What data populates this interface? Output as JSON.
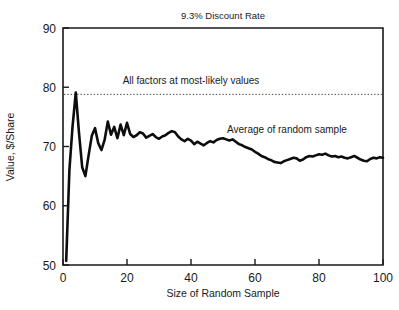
{
  "chart_data": {
    "type": "line",
    "title": "9.3% Discount Rate",
    "xlabel": "Size of Random Sample",
    "ylabel": "Value, $/Share",
    "xlim": [
      0,
      100
    ],
    "ylim": [
      50,
      90
    ],
    "xticks": [
      "0",
      "20",
      "40",
      "60",
      "80",
      "100"
    ],
    "xtick_values": [
      0,
      20,
      40,
      60,
      80,
      100
    ],
    "yticks": [
      "50",
      "60",
      "70",
      "80",
      "90"
    ],
    "ytick_values": [
      50,
      60,
      70,
      80,
      90
    ],
    "grid": false,
    "legend": "none",
    "annotations": [
      {
        "name": "most-likely-line-label",
        "text": "All factors at most-likely values",
        "x": 40,
        "y": 80.6
      },
      {
        "name": "average-curve-label",
        "text": "Average of random sample",
        "x": 70,
        "y": 72.2
      }
    ],
    "reference_lines": [
      {
        "name": "all-factors-most-likely",
        "orientation": "horizontal",
        "value": 78.8,
        "style": "dotted"
      }
    ],
    "series": [
      {
        "name": "Average of random sample",
        "style": "solid",
        "color": "#0d0d0d",
        "x": [
          1,
          2,
          3,
          4,
          5,
          6,
          7,
          8,
          9,
          10,
          11,
          12,
          13,
          14,
          15,
          16,
          17,
          18,
          19,
          20,
          21,
          22,
          23,
          24,
          25,
          26,
          27,
          28,
          29,
          30,
          31,
          32,
          33,
          34,
          35,
          36,
          37,
          38,
          39,
          40,
          41,
          42,
          43,
          44,
          45,
          46,
          47,
          48,
          49,
          50,
          51,
          52,
          53,
          54,
          55,
          56,
          57,
          58,
          59,
          60,
          61,
          62,
          63,
          64,
          65,
          66,
          67,
          68,
          69,
          70,
          71,
          72,
          73,
          74,
          75,
          76,
          77,
          78,
          79,
          80,
          81,
          82,
          83,
          84,
          85,
          86,
          87,
          88,
          89,
          90,
          91,
          92,
          93,
          94,
          95,
          96,
          97,
          98,
          99,
          100
        ],
        "values": [
          50.7,
          66.0,
          73.5,
          79.1,
          72.3,
          66.5,
          65.0,
          68.5,
          71.8,
          73.1,
          70.6,
          69.4,
          71.1,
          74.2,
          72.0,
          73.3,
          71.4,
          73.7,
          71.9,
          74.0,
          72.1,
          71.6,
          71.9,
          72.4,
          72.2,
          71.5,
          71.8,
          72.1,
          71.6,
          71.3,
          71.7,
          71.9,
          72.3,
          72.6,
          72.4,
          71.7,
          71.2,
          70.9,
          71.3,
          71.0,
          70.4,
          70.8,
          70.5,
          70.2,
          70.6,
          70.9,
          70.7,
          71.1,
          71.3,
          71.4,
          71.2,
          71.0,
          71.2,
          70.8,
          70.4,
          70.2,
          69.9,
          69.7,
          69.5,
          69.1,
          68.8,
          68.4,
          68.2,
          67.9,
          67.7,
          67.4,
          67.3,
          67.2,
          67.5,
          67.7,
          67.9,
          68.1,
          68.0,
          67.6,
          67.8,
          68.2,
          68.4,
          68.3,
          68.5,
          68.7,
          68.6,
          68.8,
          68.5,
          68.3,
          68.4,
          68.2,
          68.3,
          68.1,
          68.0,
          68.2,
          68.4,
          68.1,
          67.8,
          67.6,
          67.5,
          67.9,
          68.1,
          68.0,
          68.2,
          68.1
        ]
      }
    ]
  }
}
